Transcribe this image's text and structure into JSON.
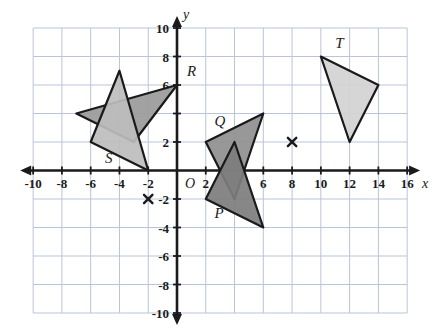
{
  "chart_data": {
    "type": "scatter",
    "title": "",
    "xlabel": "x",
    "ylabel": "y",
    "xlim": [
      -11,
      17
    ],
    "ylim": [
      -11,
      11
    ],
    "grid": true,
    "grid_step": 2,
    "legend": "none",
    "x_ticks": [
      "-10",
      "-8",
      "-6",
      "-4",
      "-2",
      "2",
      "6",
      "8",
      "10",
      "12",
      "14",
      "16"
    ],
    "x_tick_values": [
      -10,
      -8,
      -6,
      -4,
      -2,
      2,
      6,
      8,
      10,
      12,
      14,
      16
    ],
    "y_ticks": [
      "10",
      "8",
      "6",
      "2",
      "-2",
      "-4",
      "-6",
      "-8",
      "-10"
    ],
    "y_tick_values": [
      10,
      8,
      6,
      2,
      -2,
      -4,
      -6,
      -8,
      -10
    ],
    "origin_label": "O",
    "polygons": [
      {
        "label": "R",
        "label_point": [
          0.7,
          6.6
        ],
        "points": [
          [
            0,
            6
          ],
          [
            -7,
            4
          ],
          [
            -3,
            2
          ]
        ],
        "fill": "#9a9a9a",
        "stroke": "#1a1a1a"
      },
      {
        "label": "S",
        "label_point": [
          -5.0,
          0.55
        ],
        "points": [
          [
            -4,
            7
          ],
          [
            -6,
            2
          ],
          [
            -2,
            0
          ]
        ],
        "fill": "#bdbdbd",
        "stroke": "#1a1a1a"
      },
      {
        "label": "Q",
        "label_point": [
          2.6,
          3.1
        ],
        "points": [
          [
            2,
            2
          ],
          [
            6,
            4
          ],
          [
            4,
            -2
          ]
        ],
        "fill": "#8f8f8f",
        "stroke": "#1a1a1a"
      },
      {
        "label": "P",
        "label_point": [
          2.6,
          -3.3
        ],
        "points": [
          [
            2,
            -2
          ],
          [
            4,
            2
          ],
          [
            6,
            -4
          ]
        ],
        "fill": "#7d7d7d",
        "stroke": "#1a1a1a"
      },
      {
        "label": "T",
        "label_point": [
          11.0,
          8.6
        ],
        "points": [
          [
            10,
            8
          ],
          [
            14,
            6
          ],
          [
            12,
            2
          ]
        ],
        "fill": "#d2d2d2",
        "stroke": "#1a1a1a"
      }
    ],
    "markers": [
      {
        "name": "x-marker-1",
        "point": [
          8,
          2
        ],
        "symbol": "x"
      },
      {
        "name": "x-marker-2",
        "point": [
          -2,
          -2
        ],
        "symbol": "x"
      }
    ]
  },
  "colors": {
    "grid": "#b9c4d8",
    "axis": "#1a1a1a",
    "text": "#1a1a1a",
    "background": "#ffffff"
  }
}
